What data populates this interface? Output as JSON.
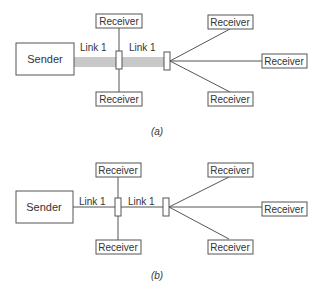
{
  "diagrams": [
    {
      "id": "a",
      "caption": "(a)",
      "sender_label": "Sender",
      "link_labels": [
        "Link 1",
        "Link 1"
      ],
      "receivers": [
        "Receiver",
        "Receiver",
        "Receiver",
        "Receiver",
        "Receiver"
      ],
      "link_style": "multiple parallel lines"
    },
    {
      "id": "b",
      "caption": "(b)",
      "sender_label": "Sender",
      "link_labels": [
        "Link 1",
        "Link 1"
      ],
      "receivers": [
        "Receiver",
        "Receiver",
        "Receiver",
        "Receiver",
        "Receiver"
      ],
      "link_style": "single line"
    }
  ]
}
